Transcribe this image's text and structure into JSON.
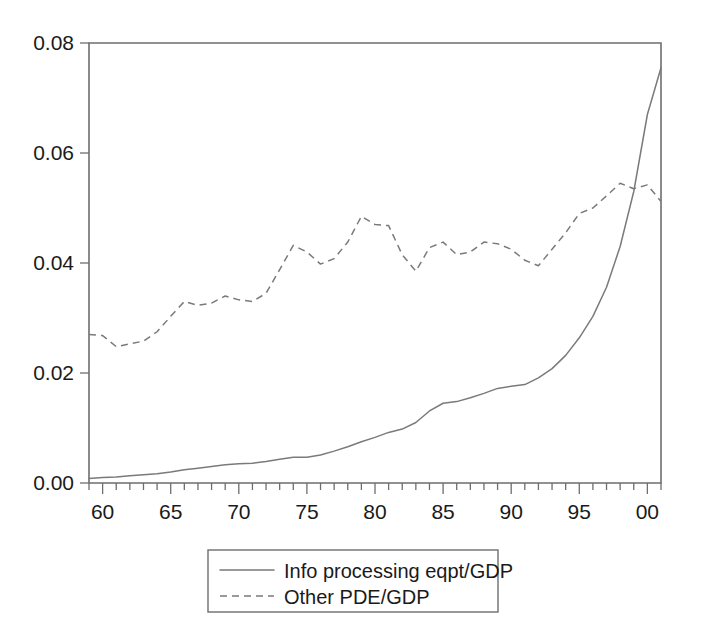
{
  "chart_data": {
    "type": "line",
    "title": "",
    "subtitle": "",
    "xlabel": "",
    "ylabel": "",
    "xlim": [
      1959,
      2001
    ],
    "ylim": [
      0.0,
      0.08
    ],
    "grid": false,
    "legend_position": "bottom-center",
    "y_ticks": [
      "0.00",
      "0.02",
      "0.04",
      "0.06",
      "0.08"
    ],
    "y_tick_values": [
      0.0,
      0.02,
      0.04,
      0.06,
      0.08
    ],
    "x_ticks": [
      "60",
      "65",
      "70",
      "75",
      "80",
      "85",
      "90",
      "95",
      "00"
    ],
    "x_tick_values": [
      1960,
      1965,
      1970,
      1975,
      1980,
      1985,
      1990,
      1995,
      2000
    ],
    "x_minor_tick_values": [
      1959,
      1960,
      1961,
      1962,
      1963,
      1964,
      1965,
      1966,
      1967,
      1968,
      1969,
      1970,
      1971,
      1972,
      1973,
      1974,
      1975,
      1976,
      1977,
      1978,
      1979,
      1980,
      1981,
      1982,
      1983,
      1984,
      1985,
      1986,
      1987,
      1988,
      1989,
      1990,
      1991,
      1992,
      1993,
      1994,
      1995,
      1996,
      1997,
      1998,
      1999,
      2000,
      2001
    ],
    "x": [
      1959,
      1960,
      1961,
      1962,
      1963,
      1964,
      1965,
      1966,
      1967,
      1968,
      1969,
      1970,
      1971,
      1972,
      1973,
      1974,
      1975,
      1976,
      1977,
      1978,
      1979,
      1980,
      1981,
      1982,
      1983,
      1984,
      1985,
      1986,
      1987,
      1988,
      1989,
      1990,
      1991,
      1992,
      1993,
      1994,
      1995,
      1996,
      1997,
      1998,
      1999,
      2000,
      2001
    ],
    "series": [
      {
        "name": "Info processing eqpt/GDP",
        "style": "solid",
        "color": "#7a7a7a",
        "values": [
          0.0008,
          0.001,
          0.0011,
          0.0013,
          0.0015,
          0.0017,
          0.002,
          0.0024,
          0.0027,
          0.003,
          0.0033,
          0.0035,
          0.0036,
          0.0039,
          0.0043,
          0.0047,
          0.0047,
          0.0051,
          0.0058,
          0.0066,
          0.0075,
          0.0083,
          0.0092,
          0.0098,
          0.011,
          0.0131,
          0.0145,
          0.0148,
          0.0155,
          0.0163,
          0.0172,
          0.0176,
          0.0179,
          0.0191,
          0.0208,
          0.0232,
          0.0264,
          0.0303,
          0.0356,
          0.043,
          0.053,
          0.067,
          0.0755
        ]
      },
      {
        "name": "Other PDE/GDP",
        "style": "dashed",
        "color": "#7a7a7a",
        "values": [
          0.027,
          0.0268,
          0.0248,
          0.0253,
          0.0258,
          0.0275,
          0.0303,
          0.033,
          0.0323,
          0.0327,
          0.034,
          0.0333,
          0.033,
          0.0345,
          0.0388,
          0.0432,
          0.042,
          0.0398,
          0.0408,
          0.0438,
          0.0485,
          0.047,
          0.0468,
          0.0415,
          0.0385,
          0.0428,
          0.0438,
          0.0415,
          0.042,
          0.0438,
          0.0435,
          0.0425,
          0.0405,
          0.0395,
          0.0425,
          0.0455,
          0.049,
          0.05,
          0.0522,
          0.0545,
          0.0535,
          0.0542,
          0.0512
        ]
      }
    ],
    "legend": [
      {
        "label": "Info processing eqpt/GDP",
        "style": "solid"
      },
      {
        "label": "Other PDE/GDP",
        "style": "dashed"
      }
    ]
  }
}
